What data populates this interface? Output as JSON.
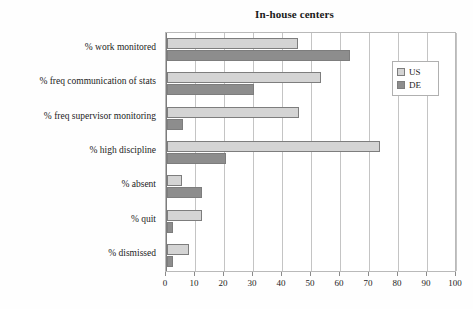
{
  "chart_data": {
    "type": "bar",
    "orientation": "horizontal",
    "title": "In-house centers",
    "xlabel": "",
    "ylabel": "",
    "xlim": [
      0,
      100
    ],
    "xticks": [
      0,
      10,
      20,
      30,
      40,
      50,
      60,
      70,
      80,
      90,
      100
    ],
    "grid": true,
    "legend_position": "top-right",
    "categories": [
      "% work monitored",
      "% freq communication of stats",
      "% freq supervisor monitoring",
      "% high discipline",
      "% absent",
      "% quit",
      "% dismissed"
    ],
    "series": [
      {
        "name": "US",
        "color": "#d4d4d4",
        "values": [
          45,
          53,
          45.5,
          73.5,
          5,
          12,
          7.5
        ]
      },
      {
        "name": "DE",
        "color": "#8d8d8d",
        "values": [
          63,
          30,
          5.5,
          20.5,
          12,
          2,
          2
        ]
      }
    ]
  },
  "legend": {
    "items": [
      {
        "label": "US"
      },
      {
        "label": "DE"
      }
    ]
  }
}
